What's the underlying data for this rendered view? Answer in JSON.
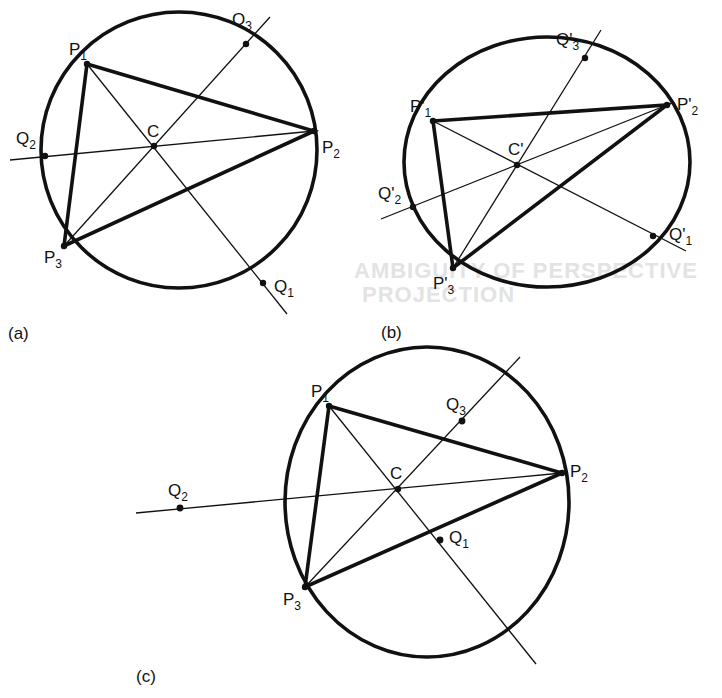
{
  "background_text": {
    "heading_line1": "AMBIGUITY OF PERSPECTIVE",
    "heading_line2": "PROJECTION"
  },
  "panels": [
    {
      "id": "a",
      "caption": "(a)",
      "shape": "circle",
      "center_label": "C",
      "points": [
        {
          "base": "P",
          "sub": "1"
        },
        {
          "base": "P",
          "sub": "2"
        },
        {
          "base": "P",
          "sub": "3"
        },
        {
          "base": "Q",
          "sub": "1"
        },
        {
          "base": "Q",
          "sub": "2"
        },
        {
          "base": "Q",
          "sub": "3"
        }
      ]
    },
    {
      "id": "b",
      "caption": "(b)",
      "shape": "ellipse",
      "center_label": "C'",
      "points": [
        {
          "base": "P'",
          "sub": "1"
        },
        {
          "base": "P'",
          "sub": "2"
        },
        {
          "base": "P'",
          "sub": "3"
        },
        {
          "base": "Q'",
          "sub": "1"
        },
        {
          "base": "Q'",
          "sub": "2"
        },
        {
          "base": "Q'",
          "sub": "3"
        }
      ]
    },
    {
      "id": "c",
      "caption": "(c)",
      "shape": "ellipse",
      "center_label": "C",
      "points": [
        {
          "base": "P",
          "sub": "1"
        },
        {
          "base": "P",
          "sub": "2"
        },
        {
          "base": "P",
          "sub": "3"
        },
        {
          "base": "Q",
          "sub": "1"
        },
        {
          "base": "Q",
          "sub": "2"
        },
        {
          "base": "Q",
          "sub": "3"
        }
      ]
    }
  ]
}
